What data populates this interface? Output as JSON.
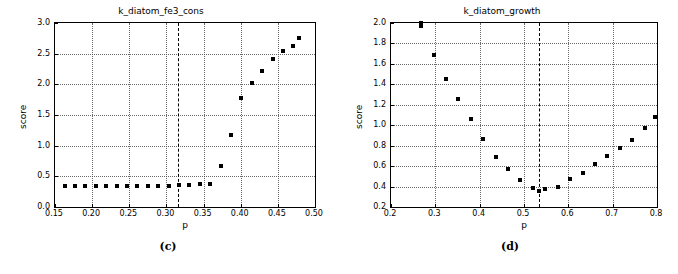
{
  "figure": {
    "captions": {
      "left": "(c)",
      "right": "(d)"
    }
  },
  "chart_data": [
    {
      "type": "scatter",
      "title": "k_diatom_fe3_cons",
      "xlabel": "p",
      "ylabel": "score",
      "xlim": [
        0.15,
        0.5
      ],
      "ylim": [
        0.0,
        3.0
      ],
      "xticks": [
        "0.15",
        "0.20",
        "0.25",
        "0.30",
        "0.35",
        "0.40",
        "0.45",
        "0.50"
      ],
      "xtickvals": [
        0.15,
        0.2,
        0.25,
        0.3,
        0.35,
        0.4,
        0.45,
        0.5
      ],
      "yticks": [
        "0.0",
        "0.5",
        "1.0",
        "1.5",
        "2.0",
        "2.5",
        "3.0"
      ],
      "ytickvals": [
        0.0,
        0.5,
        1.0,
        1.5,
        2.0,
        2.5,
        3.0
      ],
      "grid": true,
      "legend": "none",
      "vline": 0.315,
      "marker": "square",
      "marker_color": "#000000",
      "x": [
        0.163,
        0.177,
        0.191,
        0.205,
        0.219,
        0.233,
        0.247,
        0.261,
        0.275,
        0.289,
        0.303,
        0.317,
        0.331,
        0.345,
        0.359,
        0.373,
        0.387,
        0.401,
        0.415,
        0.429,
        0.443,
        0.457,
        0.471,
        0.479
      ],
      "y": [
        0.35,
        0.35,
        0.35,
        0.35,
        0.35,
        0.35,
        0.35,
        0.35,
        0.35,
        0.35,
        0.35,
        0.36,
        0.36,
        0.37,
        0.38,
        0.67,
        1.17,
        1.77,
        2.02,
        2.22,
        2.41,
        2.54,
        2.63,
        2.75
      ]
    },
    {
      "type": "scatter",
      "title": "k_diatom_growth",
      "xlabel": "p",
      "ylabel": "score",
      "xlim": [
        0.2,
        0.8
      ],
      "ylim": [
        0.2,
        2.0
      ],
      "xticks": [
        "0.2",
        "0.3",
        "0.4",
        "0.5",
        "0.6",
        "0.7",
        "0.8"
      ],
      "xtickvals": [
        0.2,
        0.3,
        0.4,
        0.5,
        0.6,
        0.7,
        0.8
      ],
      "yticks": [
        "0.2",
        "0.4",
        "0.6",
        "0.8",
        "1.0",
        "1.2",
        "1.4",
        "1.6",
        "1.8",
        "2.0"
      ],
      "ytickvals": [
        0.2,
        0.4,
        0.6,
        0.8,
        1.0,
        1.2,
        1.4,
        1.6,
        1.8,
        2.0
      ],
      "grid": true,
      "legend": "none",
      "vline": 0.533,
      "marker": "square",
      "marker_color": "#000000",
      "x": [
        0.268,
        0.268,
        0.296,
        0.324,
        0.352,
        0.38,
        0.408,
        0.436,
        0.464,
        0.492,
        0.52,
        0.533,
        0.548,
        0.576,
        0.604,
        0.632,
        0.66,
        0.688,
        0.716,
        0.744,
        0.772,
        0.796
      ],
      "y": [
        2.0,
        1.97,
        1.69,
        1.45,
        1.26,
        1.06,
        0.87,
        0.69,
        0.57,
        0.46,
        0.39,
        0.355,
        0.38,
        0.4,
        0.47,
        0.53,
        0.62,
        0.7,
        0.78,
        0.86,
        0.97,
        1.08
      ]
    }
  ]
}
